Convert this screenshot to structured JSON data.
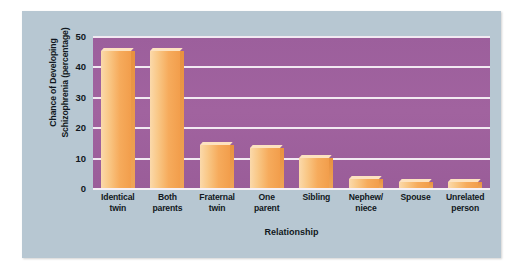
{
  "chart_data": {
    "type": "bar",
    "title": "",
    "xlabel": "Relationship",
    "ylabel": "Chance of Developing Schizophrenia (percentage)",
    "ylabel_line1": "Chance of Developing",
    "ylabel_line2": "Schizophrenia (percentage)",
    "categories": [
      "Identical twin",
      "Both parents",
      "Fraternal twin",
      "One parent",
      "Sibling",
      "Nephew/ niece",
      "Spouse",
      "Unrelated person"
    ],
    "category_lines": [
      [
        "Identical",
        "twin"
      ],
      [
        "Both",
        "parents"
      ],
      [
        "Fraternal",
        "twin"
      ],
      [
        "One",
        "parent"
      ],
      [
        "Sibling",
        ""
      ],
      [
        "Nephew/",
        "niece"
      ],
      [
        "Spouse",
        ""
      ],
      [
        "Unrelated",
        "person"
      ]
    ],
    "values": [
      45,
      45,
      14,
      13,
      10,
      3,
      2,
      2
    ],
    "ylim": [
      0,
      50
    ],
    "yticks": [
      0,
      10,
      20,
      30,
      40,
      50
    ],
    "ytick_labels": [
      "0",
      "10",
      "20",
      "30",
      "40",
      "50"
    ],
    "grid": true,
    "legend": "none",
    "colors": {
      "plot_background": "#9f629e",
      "panel_background": "#b7c7d2",
      "bar_fill": "#f8b268",
      "bar_highlight": "#fbd9ab",
      "bar_shadow": "#e8913f",
      "gridline": "#f2eaf2",
      "text": "#111821",
      "page_background": "#ffffff"
    }
  }
}
